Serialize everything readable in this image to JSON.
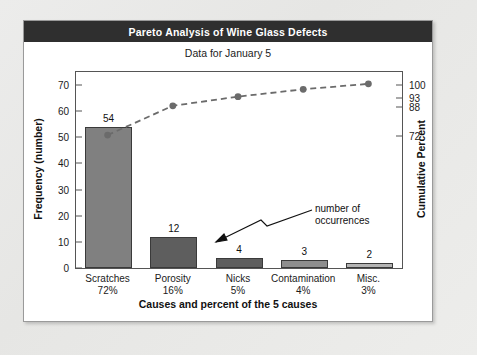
{
  "card": {
    "title": "Pareto Analysis of Wine Glass Defects",
    "subtitle": "Data for January 5",
    "title_bg": "#2f2f2f",
    "title_color": "#ffffff"
  },
  "annotation": {
    "line1": "number of",
    "line2": "occurrences"
  },
  "chart_data": {
    "type": "bar",
    "title": "Pareto Analysis of Wine Glass Defects",
    "subtitle": "Data for January 5",
    "xlabel": "Causes and percent of the 5 causes",
    "ylabel": "Frequency (number)",
    "y2label": "Cumulative Percent",
    "categories": [
      "Scratches",
      "Porosity",
      "Nicks",
      "Contamination",
      "Misc."
    ],
    "category_percents": [
      "72%",
      "16%",
      "5%",
      "4%",
      "3%"
    ],
    "values": [
      54,
      12,
      4,
      3,
      2
    ],
    "value_labels": [
      "54",
      "12",
      "4",
      "3",
      "2"
    ],
    "cumulative_percent": [
      72,
      88,
      93,
      97,
      100
    ],
    "ylim": [
      0,
      75
    ],
    "yticks": [
      0,
      10,
      20,
      30,
      40,
      50,
      60,
      70
    ],
    "y2ticks": [
      72,
      88,
      93,
      100
    ],
    "y2lim": [
      0,
      107
    ],
    "grid": false,
    "legend": "none",
    "bar_colors": [
      "#808080",
      "#5e5e5e",
      "#5e5e5e",
      "#8e8e8e",
      "#b4b4b4"
    ],
    "line_color": "#6b6b6b",
    "line_style": "dashed",
    "marker": "circle"
  }
}
